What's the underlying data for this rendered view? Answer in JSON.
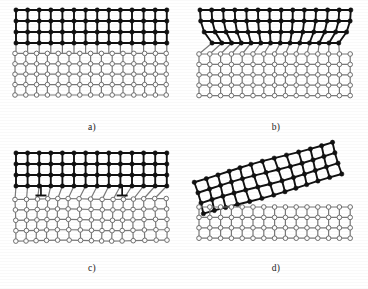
{
  "figure": {
    "background_color": "#ffffff",
    "film_color": "#111111",
    "substrate_line_color": "#7a7a7a",
    "substrate_node_fill": "#ffffff",
    "substrate_node_stroke": "#6e6e6e",
    "dislocation_symbol": "inverted-tee"
  },
  "panels": [
    {
      "id": "a",
      "label": "a)",
      "caption": "Unstrained film and substrate with mismatched lattice constants",
      "film": {
        "node_type": "filled",
        "rows": 4,
        "cols": 13,
        "cell_width": 11.6,
        "cell_height": 11.0,
        "node_radius": 2.2,
        "line_width": 1.9
      },
      "substrate": {
        "node_type": "open",
        "rows": 5,
        "cols": 14,
        "cell_width": 10.8,
        "cell_height": 10.4,
        "node_radius": 2.3,
        "line_width": 1.2
      },
      "interface": "abrupt",
      "origin_x": 16,
      "origin_y": 14
    },
    {
      "id": "b",
      "label": "b)",
      "caption": "Coherently strained film: lattice planes bend to match substrate near the interface",
      "film": {
        "node_type": "filled",
        "rows": 4,
        "cols": 13,
        "cell_width": 11.6,
        "cell_height": 11.0,
        "node_radius": 2.2,
        "line_width": 1.9
      },
      "substrate": {
        "node_type": "open",
        "rows": 5,
        "cols": 14,
        "cell_width": 10.8,
        "cell_height": 10.4,
        "node_radius": 2.3,
        "line_width": 1.2
      },
      "interface": "strained-bent",
      "origin_x": 200,
      "origin_y": 14
    },
    {
      "id": "c",
      "label": "c)",
      "caption": "Relaxed film containing misfit dislocations at the interface",
      "film": {
        "node_type": "filled",
        "rows": 4,
        "cols": 13,
        "cell_width": 11.6,
        "cell_height": 11.0,
        "node_radius": 2.2,
        "line_width": 1.9
      },
      "substrate": {
        "node_type": "open",
        "rows": 5,
        "cols": 14,
        "cell_width": 10.8,
        "cell_height": 10.4,
        "node_radius": 2.3,
        "line_width": 1.2
      },
      "interface": "misfit-dislocations",
      "dislocation_count": 2,
      "dislocation_columns": [
        2,
        9
      ],
      "origin_x": 16,
      "origin_y": 158
    },
    {
      "id": "d",
      "label": "d)",
      "caption": "Film detached and rotated relative to the substrate",
      "film": {
        "node_type": "filled",
        "rows": 4,
        "cols": 12,
        "cell_width": 12.0,
        "cell_height": 11.4,
        "node_radius": 2.2,
        "line_width": 1.9,
        "rotation_degrees": -16
      },
      "substrate": {
        "node_type": "open",
        "rows": 4,
        "cols": 14,
        "cell_width": 10.8,
        "cell_height": 10.4,
        "node_radius": 2.3,
        "line_width": 1.2
      },
      "interface": "detached-rotated",
      "origin_x": 200,
      "origin_y": 158
    }
  ]
}
